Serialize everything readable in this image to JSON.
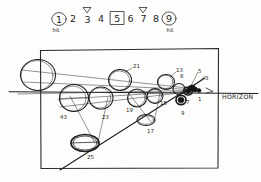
{
  "sketch": {
    "title": "perspective-ball-sequence-sketch",
    "ink_color": "#1d1d1d",
    "paper_color": "#fdfdfb"
  },
  "number_row": {
    "items": [
      {
        "value": "1",
        "marker": "circled",
        "note": "hit"
      },
      {
        "value": "2",
        "marker": "none",
        "note": ""
      },
      {
        "value": "3",
        "marker": "caret-above",
        "note": ""
      },
      {
        "value": "4",
        "marker": "none",
        "note": ""
      },
      {
        "value": "5",
        "marker": "boxed",
        "note": ""
      },
      {
        "value": "6",
        "marker": "none",
        "note": ""
      },
      {
        "value": "7",
        "marker": "caret-above",
        "note": ""
      },
      {
        "value": "8",
        "marker": "none",
        "note": ""
      },
      {
        "value": "9",
        "marker": "circled",
        "note": "hit"
      }
    ]
  },
  "scene": {
    "horizon_label": "HORIZON",
    "ball_labels": [
      "43",
      "23",
      "25",
      "21",
      "19",
      "17",
      "13",
      "15",
      "9",
      "8",
      "7",
      "5",
      "3",
      "1"
    ]
  }
}
